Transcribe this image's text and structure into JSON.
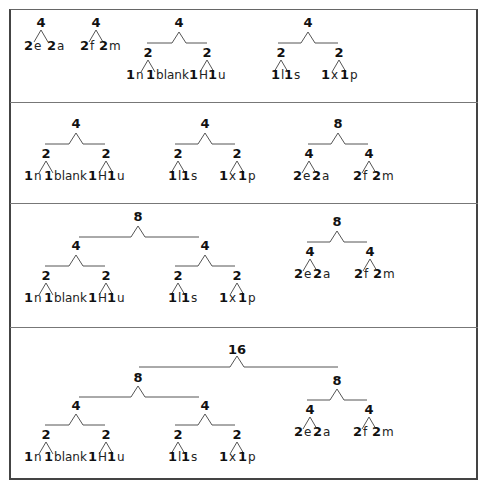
{
  "diagram": {
    "panels": [
      {
        "id": "panel-1",
        "trees": [
          {
            "root": "4",
            "children": [
              {
                "weight": "2",
                "symbol": "e"
              },
              {
                "weight": "2",
                "symbol": "a"
              }
            ]
          },
          {
            "root": "4",
            "children": [
              {
                "weight": "2",
                "symbol": "f"
              },
              {
                "weight": "2",
                "symbol": "m"
              }
            ]
          },
          {
            "root": "4",
            "children": [
              {
                "root": "2",
                "children": [
                  {
                    "weight": "1",
                    "symbol": "n"
                  },
                  {
                    "weight": "1",
                    "symbol": "blank"
                  }
                ]
              },
              {
                "root": "2",
                "children": [
                  {
                    "weight": "1",
                    "symbol": "H"
                  },
                  {
                    "weight": "1",
                    "symbol": "u"
                  }
                ]
              }
            ]
          },
          {
            "root": "4",
            "children": [
              {
                "root": "2",
                "children": [
                  {
                    "weight": "1",
                    "symbol": "l"
                  },
                  {
                    "weight": "1",
                    "symbol": "s"
                  }
                ]
              },
              {
                "root": "2",
                "children": [
                  {
                    "weight": "1",
                    "symbol": "x"
                  },
                  {
                    "weight": "1",
                    "symbol": "p"
                  }
                ]
              }
            ]
          }
        ]
      },
      {
        "id": "panel-2",
        "trees": [
          {
            "root": "4",
            "children": [
              {
                "root": "2",
                "children": [
                  {
                    "weight": "1",
                    "symbol": "n"
                  },
                  {
                    "weight": "1",
                    "symbol": "blank"
                  }
                ]
              },
              {
                "root": "2",
                "children": [
                  {
                    "weight": "1",
                    "symbol": "H"
                  },
                  {
                    "weight": "1",
                    "symbol": "u"
                  }
                ]
              }
            ]
          },
          {
            "root": "4",
            "children": [
              {
                "root": "2",
                "children": [
                  {
                    "weight": "1",
                    "symbol": "l"
                  },
                  {
                    "weight": "1",
                    "symbol": "s"
                  }
                ]
              },
              {
                "root": "2",
                "children": [
                  {
                    "weight": "1",
                    "symbol": "x"
                  },
                  {
                    "weight": "1",
                    "symbol": "p"
                  }
                ]
              }
            ]
          },
          {
            "root": "8",
            "children": [
              {
                "root": "4",
                "children": [
                  {
                    "weight": "2",
                    "symbol": "e"
                  },
                  {
                    "weight": "2",
                    "symbol": "a"
                  }
                ]
              },
              {
                "root": "4",
                "children": [
                  {
                    "weight": "2",
                    "symbol": "f"
                  },
                  {
                    "weight": "2",
                    "symbol": "m"
                  }
                ]
              }
            ]
          }
        ]
      },
      {
        "id": "panel-3",
        "trees": [
          {
            "root": "8",
            "children": [
              {
                "root": "4",
                "children": [
                  {
                    "root": "2",
                    "children": [
                      {
                        "weight": "1",
                        "symbol": "n"
                      },
                      {
                        "weight": "1",
                        "symbol": "blank"
                      }
                    ]
                  },
                  {
                    "root": "2",
                    "children": [
                      {
                        "weight": "1",
                        "symbol": "H"
                      },
                      {
                        "weight": "1",
                        "symbol": "u"
                      }
                    ]
                  }
                ]
              },
              {
                "root": "4",
                "children": [
                  {
                    "root": "2",
                    "children": [
                      {
                        "weight": "1",
                        "symbol": "l"
                      },
                      {
                        "weight": "1",
                        "symbol": "s"
                      }
                    ]
                  },
                  {
                    "root": "2",
                    "children": [
                      {
                        "weight": "1",
                        "symbol": "x"
                      },
                      {
                        "weight": "1",
                        "symbol": "p"
                      }
                    ]
                  }
                ]
              }
            ]
          },
          {
            "root": "8",
            "children": [
              {
                "root": "4",
                "children": [
                  {
                    "weight": "2",
                    "symbol": "e"
                  },
                  {
                    "weight": "2",
                    "symbol": "a"
                  }
                ]
              },
              {
                "root": "4",
                "children": [
                  {
                    "weight": "2",
                    "symbol": "f"
                  },
                  {
                    "weight": "2",
                    "symbol": "m"
                  }
                ]
              }
            ]
          }
        ]
      },
      {
        "id": "panel-4",
        "trees": [
          {
            "root": "16",
            "children": [
              {
                "root": "8",
                "children": [
                  {
                    "root": "4",
                    "children": [
                      {
                        "root": "2",
                        "children": [
                          {
                            "weight": "1",
                            "symbol": "n"
                          },
                          {
                            "weight": "1",
                            "symbol": "blank"
                          }
                        ]
                      },
                      {
                        "root": "2",
                        "children": [
                          {
                            "weight": "1",
                            "symbol": "H"
                          },
                          {
                            "weight": "1",
                            "symbol": "u"
                          }
                        ]
                      }
                    ]
                  },
                  {
                    "root": "4",
                    "children": [
                      {
                        "root": "2",
                        "children": [
                          {
                            "weight": "1",
                            "symbol": "l"
                          },
                          {
                            "weight": "1",
                            "symbol": "s"
                          }
                        ]
                      },
                      {
                        "root": "2",
                        "children": [
                          {
                            "weight": "1",
                            "symbol": "x"
                          },
                          {
                            "weight": "1",
                            "symbol": "p"
                          }
                        ]
                      }
                    ]
                  }
                ]
              },
              {
                "root": "8",
                "children": [
                  {
                    "root": "4",
                    "children": [
                      {
                        "weight": "2",
                        "symbol": "e"
                      },
                      {
                        "weight": "2",
                        "symbol": "a"
                      }
                    ]
                  },
                  {
                    "root": "4",
                    "children": [
                      {
                        "weight": "2",
                        "symbol": "f"
                      },
                      {
                        "weight": "2",
                        "symbol": "m"
                      }
                    ]
                  }
                ]
              }
            ]
          }
        ]
      }
    ]
  },
  "labels": {
    "w1": "1",
    "w2": "2",
    "w4": "4",
    "w8": "8",
    "w16": "16",
    "e": "e",
    "a": "a",
    "f": "f",
    "m": "m",
    "n": "n",
    "blank": "blank",
    "H": "H",
    "u": "u",
    "l": "l",
    "s": "s",
    "x": "x",
    "p": "p"
  },
  "colors": {
    "line": "#555555",
    "border": "#444444",
    "text": "#111111"
  }
}
